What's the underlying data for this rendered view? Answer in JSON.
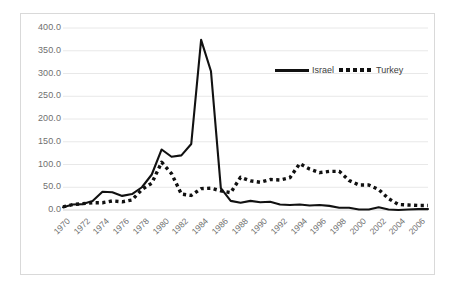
{
  "chart_data": {
    "type": "line",
    "title": "",
    "subtitle": "",
    "xlabel": "",
    "ylabel": "",
    "grid": true,
    "legend_position": "inside-top-right",
    "xlim": [
      1970,
      2007
    ],
    "ylim": [
      0,
      400
    ],
    "yticks": [
      "0.0",
      "50.0",
      "100.0",
      "150.0",
      "200.0",
      "250.0",
      "300.0",
      "350.0",
      "400.0"
    ],
    "ytick_values": [
      0,
      50,
      100,
      150,
      200,
      250,
      300,
      350,
      400
    ],
    "xticks": [
      "1970",
      "1972",
      "1974",
      "1976",
      "1978",
      "1980",
      "1982",
      "1984",
      "1986",
      "1988",
      "1990",
      "1992",
      "1994",
      "1996",
      "1998",
      "2000",
      "2002",
      "2004",
      "2006"
    ],
    "xtick_values": [
      1970,
      1972,
      1974,
      1976,
      1978,
      1980,
      1982,
      1984,
      1986,
      1988,
      1990,
      1992,
      1994,
      1996,
      1998,
      2000,
      2002,
      2004,
      2006
    ],
    "x": [
      1970,
      1971,
      1972,
      1973,
      1974,
      1975,
      1976,
      1977,
      1978,
      1979,
      1980,
      1981,
      1982,
      1983,
      1984,
      1985,
      1986,
      1987,
      1988,
      1989,
      1990,
      1991,
      1992,
      1993,
      1994,
      1995,
      1996,
      1997,
      1998,
      1999,
      2000,
      2001,
      2002,
      2003,
      2004,
      2005,
      2006,
      2007
    ],
    "series": [
      {
        "name": "Israel",
        "style": "solid",
        "color": "#111111",
        "values": [
          6,
          12,
          13,
          20,
          40,
          39,
          31,
          35,
          50,
          78,
          133,
          117,
          120,
          145,
          374,
          305,
          48,
          20,
          16,
          20,
          17,
          18,
          12,
          11,
          12,
          10,
          11,
          9,
          5,
          5,
          1,
          1,
          6,
          1,
          0,
          1,
          2,
          2
        ]
      },
      {
        "name": "Turkey",
        "style": "dotted",
        "color": "#111111",
        "values": [
          7,
          12,
          14,
          16,
          16,
          20,
          18,
          22,
          45,
          59,
          105,
          80,
          35,
          32,
          47,
          48,
          42,
          38,
          72,
          64,
          61,
          67,
          66,
          71,
          102,
          90,
          82,
          85,
          85,
          65,
          55,
          55,
          45,
          25,
          12,
          11,
          10,
          10
        ]
      }
    ],
    "legend": [
      {
        "label": "Israel",
        "style": "solid"
      },
      {
        "label": "Turkey",
        "style": "dotted"
      }
    ]
  },
  "colors": {
    "series": "#111111",
    "grid": "#e8e8e8",
    "frame": "#d9d9d9",
    "tick_text": "#6f6f6f",
    "legend_text": "#404040",
    "background": "#ffffff"
  }
}
